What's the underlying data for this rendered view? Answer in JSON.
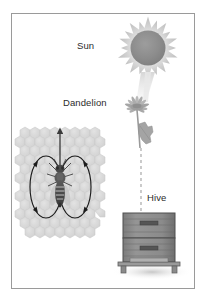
{
  "figure": {
    "background_color": "#ffffff",
    "frame_color": "#9a9a9a",
    "label_color": "#2b2b2b"
  },
  "labels": {
    "sun": "Sun",
    "dandelion": "Dandelion",
    "hive": "Hive"
  },
  "elements": {
    "sun": {
      "name": "Sun",
      "disc_color": "#8d8d8d",
      "ray_color": "#c9c9c9",
      "center_x": 148,
      "center_y": 48,
      "disc_radius": 17,
      "ray_count": 20,
      "ray_length": 14
    },
    "dandelion": {
      "name": "Dandelion",
      "flower_color": "#b4b4b4",
      "stem_color": "#9d9d9d",
      "leaf_color": "#a6a6a6",
      "center_x": 137,
      "center_y": 112
    },
    "honeycomb": {
      "name": "Honeycomb",
      "cell_color": "#d8d8d8",
      "cell_outline": "#c2c2c2",
      "left": 14,
      "top": 126,
      "width": 92,
      "height": 114
    },
    "bee": {
      "name": "Honeybee",
      "body_color": "#4a4a4a",
      "stripe_color": "#8a8a8a",
      "wing_color": "#bcbcbc",
      "center_x": 60,
      "center_y": 187
    },
    "hive": {
      "name": "Beehive box",
      "box_color": "#8c8c8c",
      "box_outline": "#4f4f4f",
      "stand_color": "#9a9a9a",
      "shadow_color": "#d5d5d5",
      "left": 123,
      "top": 213,
      "width": 52,
      "height": 52
    },
    "dance_path": {
      "name": "Figure-eight waggle dance path",
      "stroke_color": "#1c1c1c",
      "arrow_color": "#1c1c1c",
      "left_loop_center_x": 46,
      "right_loop_center_x": 75,
      "loop_center_y": 187,
      "loop_rx": 16,
      "loop_ry": 31
    },
    "waggle_arrow": {
      "name": "Waggle run direction arrow",
      "color": "#3a3a3a",
      "x": 60,
      "y_top": 127,
      "y_bottom": 186
    },
    "sight_line": {
      "name": "Dashed line from dandelion to hive",
      "color": "#a8a8a8",
      "x": 141,
      "y_top": 150,
      "y_bottom": 216,
      "style": "dashed"
    },
    "sun_ray_beam": {
      "name": "Sunlight beam to dandelion",
      "color": "#dcdcdc"
    }
  }
}
